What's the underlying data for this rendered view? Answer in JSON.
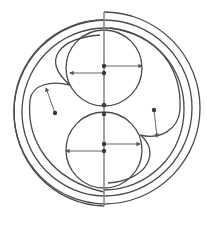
{
  "diagram": {
    "title": "",
    "colors": {
      "line": "#4a4a4a",
      "axis": "#8a8a8a",
      "dot": "#3a3a3a",
      "background": "#ffffff"
    },
    "elements": {
      "axis": {
        "x": 104,
        "y1": 12,
        "y2": 206
      },
      "upper_circle": {
        "cx": 104,
        "cy": 68,
        "r": 38
      },
      "lower_circle": {
        "cx": 104,
        "cy": 150,
        "r": 38
      },
      "dots": [
        {
          "x": 104,
          "y": 66
        },
        {
          "x": 104,
          "y": 73
        },
        {
          "x": 104,
          "y": 105
        },
        {
          "x": 104,
          "y": 114
        },
        {
          "x": 104,
          "y": 144
        },
        {
          "x": 104,
          "y": 151
        },
        {
          "x": 55,
          "y": 113
        },
        {
          "x": 154,
          "y": 110
        }
      ],
      "arrows": [
        {
          "x1": 104,
          "y1": 66,
          "x2": 142,
          "y2": 66
        },
        {
          "x1": 104,
          "y1": 73,
          "x2": 70,
          "y2": 73
        },
        {
          "x1": 104,
          "y1": 144,
          "x2": 140,
          "y2": 144
        },
        {
          "x1": 104,
          "y1": 151,
          "x2": 66,
          "y2": 151
        },
        {
          "x1": 55,
          "y1": 113,
          "x2": 46,
          "y2": 88
        },
        {
          "x1": 154,
          "y1": 110,
          "x2": 157,
          "y2": 137
        }
      ]
    }
  }
}
